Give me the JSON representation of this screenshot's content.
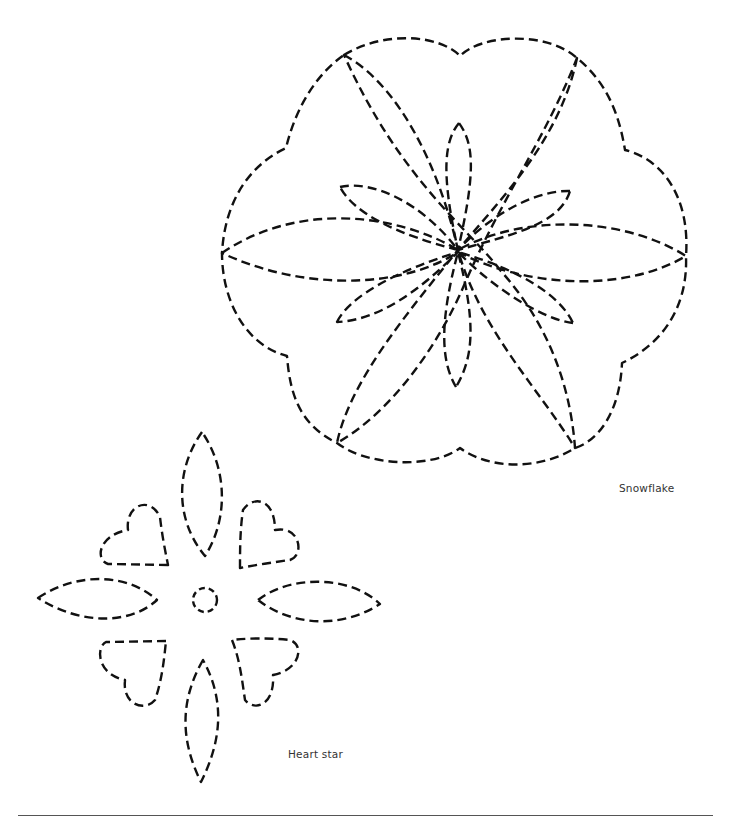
{
  "document": {
    "type": "quilting pattern page",
    "stitch_color": "#111111",
    "rule_color": "#555555"
  },
  "patterns": [
    {
      "id": "snowflake",
      "caption": "Snowflake",
      "icon": "snowflake-stitch-pattern"
    },
    {
      "id": "heart_star",
      "caption": "Heart star",
      "icon": "heart-star-stitch-pattern"
    }
  ]
}
